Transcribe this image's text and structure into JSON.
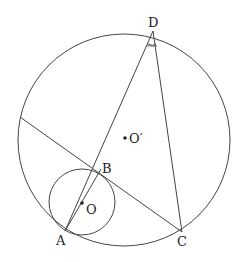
{
  "diagram": {
    "title": "",
    "points": {
      "A": {
        "label": "A",
        "x": 65,
        "y": 231
      },
      "B": {
        "label": "B",
        "x": 101,
        "y": 169
      },
      "C": {
        "label": "C",
        "x": 182,
        "y": 232
      },
      "D": {
        "label": "D",
        "x": 153,
        "y": 31
      },
      "O": {
        "label": "O",
        "x": 82,
        "y": 203
      },
      "O_prime": {
        "label": "O′",
        "x": 125,
        "y": 138
      }
    },
    "circles": {
      "big": {
        "cx": 124,
        "cy": 140,
        "r": 106,
        "center": "O′"
      },
      "small": {
        "cx": 82,
        "cy": 202,
        "r": 33,
        "center": "O"
      }
    },
    "segments": [
      "A-D",
      "D-C",
      "tangent-line through B to C",
      "A-B through O"
    ],
    "angle_mark": "angle ADC"
  }
}
